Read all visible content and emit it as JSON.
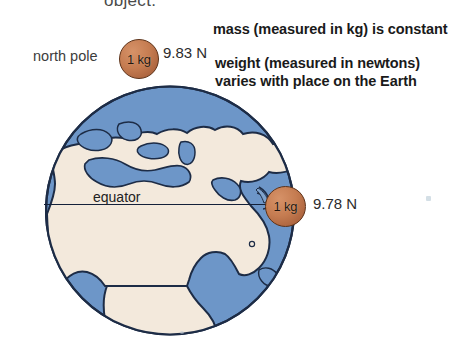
{
  "page": {
    "background_color": "#ffffff",
    "width": 466,
    "height": 360,
    "cut_off_heading": "object."
  },
  "annotations": {
    "mass_note": "mass (measured in kg) is constant",
    "weight_note_line1": "weight (measured in newtons)",
    "weight_note_line2": "varies with place on the Earth"
  },
  "diagram": {
    "title_labels": {
      "north_pole": "north pole",
      "equator": "equator"
    },
    "earth": {
      "ocean_color": "#6d96c8",
      "land_color": "#f3e9dc",
      "outline_color": "#1d2c46"
    },
    "measurements": [
      {
        "location": "north pole",
        "mass_label": "1 kg",
        "weight_label": "9.83 N",
        "ball_color": "#c57c51"
      },
      {
        "location": "equator",
        "mass_label": "1 kg",
        "weight_label": "9.78 N",
        "ball_color": "#c57c51"
      }
    ]
  }
}
